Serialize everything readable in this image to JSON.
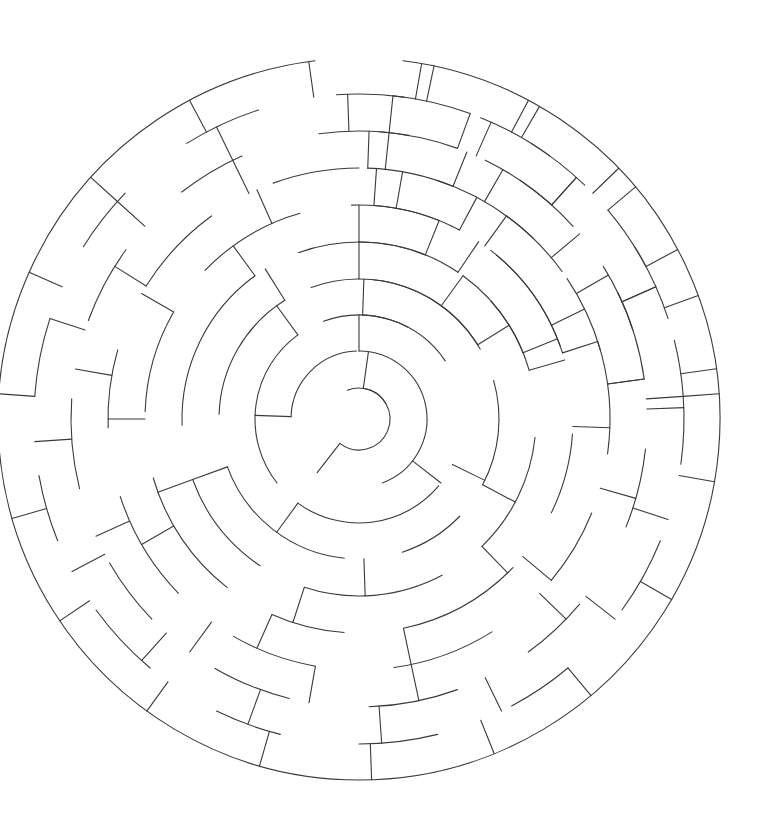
{
  "page": {
    "background_color": "#ffffff",
    "width": 759,
    "height": 827
  },
  "maze": {
    "kind": "circular-radial-maze",
    "description": "Concentric-ring maze with arc walls and radial walls",
    "stroke_color": "#3a3a3a",
    "stroke_width": 1.1,
    "center": {
      "x": 359,
      "y": 419
    },
    "ring_count": 10,
    "ring_radii": [
      31,
      68,
      104,
      140,
      177,
      214,
      251,
      288,
      325,
      361
    ],
    "entrance": {
      "ring": 9,
      "angle_deg": -90,
      "label": "top-entrance-gap"
    },
    "exit": {
      "ring": 0,
      "angle_deg": 215,
      "label": "center-goal-gap"
    },
    "arc_walls": [
      [
        0,
        -82,
        210
      ],
      [
        0,
        248,
        82
      ],
      [
        1,
        -90,
        160
      ],
      [
        1,
        182,
        86
      ],
      [
        2,
        -88,
        26
      ],
      [
        2,
        40,
        86
      ],
      [
        2,
        142,
        92
      ],
      [
        2,
        250,
        76
      ],
      [
        3,
        -84,
        52
      ],
      [
        3,
        -16,
        44
      ],
      [
        3,
        44,
        28
      ],
      [
        3,
        96,
        64
      ],
      [
        3,
        182,
        56
      ],
      [
        3,
        250,
        80
      ],
      [
        4,
        -90,
        34
      ],
      [
        4,
        -42,
        26
      ],
      [
        4,
        6,
        40
      ],
      [
        4,
        62,
        46
      ],
      [
        4,
        124,
        36
      ],
      [
        4,
        178,
        56
      ],
      [
        4,
        250,
        42
      ],
      [
        4,
        306,
        32
      ],
      [
        5,
        -86,
        24
      ],
      [
        5,
        -50,
        30
      ],
      [
        5,
        4,
        22
      ],
      [
        5,
        44,
        34
      ],
      [
        5,
        94,
        20
      ],
      [
        5,
        128,
        36
      ],
      [
        5,
        182,
        28
      ],
      [
        5,
        224,
        30
      ],
      [
        5,
        268,
        24
      ],
      [
        5,
        308,
        34
      ],
      [
        6,
        -88,
        20
      ],
      [
        6,
        -54,
        18
      ],
      [
        6,
        -18,
        26
      ],
      [
        6,
        22,
        18
      ],
      [
        6,
        58,
        24
      ],
      [
        6,
        100,
        20
      ],
      [
        6,
        136,
        26
      ],
      [
        6,
        178,
        18
      ],
      [
        6,
        212,
        22
      ],
      [
        6,
        250,
        20
      ],
      [
        6,
        288,
        26
      ],
      [
        6,
        326,
        18
      ],
      [
        7,
        -86,
        16
      ],
      [
        7,
        -56,
        14
      ],
      [
        7,
        -26,
        18
      ],
      [
        7,
        6,
        16
      ],
      [
        7,
        40,
        14
      ],
      [
        7,
        70,
        18
      ],
      [
        7,
        104,
        16
      ],
      [
        7,
        136,
        14
      ],
      [
        7,
        166,
        18
      ],
      [
        7,
        200,
        16
      ],
      [
        7,
        232,
        14
      ],
      [
        7,
        262,
        18
      ],
      [
        7,
        296,
        16
      ],
      [
        7,
        328,
        14
      ],
      [
        8,
        -84,
        14
      ],
      [
        8,
        -58,
        12
      ],
      [
        8,
        -32,
        14
      ],
      [
        8,
        -4,
        12
      ],
      [
        8,
        22,
        14
      ],
      [
        8,
        50,
        12
      ],
      [
        8,
        76,
        14
      ],
      [
        8,
        104,
        12
      ],
      [
        8,
        130,
        14
      ],
      [
        8,
        158,
        12
      ],
      [
        8,
        184,
        14
      ],
      [
        8,
        212,
        12
      ],
      [
        8,
        238,
        14
      ],
      [
        8,
        266,
        12
      ],
      [
        8,
        292,
        14
      ],
      [
        8,
        320,
        12
      ],
      [
        8,
        346,
        10
      ]
    ],
    "radial_walls": [
      [
        0,
        1,
        -82
      ],
      [
        0,
        1,
        128
      ],
      [
        1,
        2,
        -90
      ],
      [
        1,
        2,
        38
      ],
      [
        1,
        2,
        182
      ],
      [
        2,
        3,
        -88
      ],
      [
        2,
        3,
        26
      ],
      [
        2,
        3,
        126
      ],
      [
        2,
        3,
        234
      ],
      [
        3,
        4,
        -90
      ],
      [
        3,
        4,
        -32
      ],
      [
        3,
        4,
        28
      ],
      [
        3,
        4,
        88
      ],
      [
        3,
        4,
        160
      ],
      [
        3,
        4,
        238
      ],
      [
        3,
        4,
        306
      ],
      [
        4,
        5,
        -90
      ],
      [
        4,
        5,
        -56
      ],
      [
        4,
        5,
        -16
      ],
      [
        4,
        5,
        46
      ],
      [
        4,
        5,
        108
      ],
      [
        4,
        5,
        160
      ],
      [
        4,
        5,
        234
      ],
      [
        4,
        5,
        292
      ],
      [
        4,
        5,
        338
      ],
      [
        5,
        6,
        -86
      ],
      [
        5,
        6,
        -62
      ],
      [
        5,
        6,
        -26
      ],
      [
        5,
        6,
        2
      ],
      [
        5,
        6,
        40
      ],
      [
        5,
        6,
        78
      ],
      [
        5,
        6,
        114
      ],
      [
        5,
        6,
        150
      ],
      [
        5,
        6,
        180
      ],
      [
        5,
        6,
        210
      ],
      [
        5,
        6,
        246
      ],
      [
        5,
        6,
        280
      ],
      [
        5,
        6,
        306
      ],
      [
        5,
        6,
        342
      ],
      [
        6,
        7,
        -88
      ],
      [
        6,
        7,
        -68
      ],
      [
        6,
        7,
        -40
      ],
      [
        6,
        7,
        -8
      ],
      [
        6,
        7,
        16
      ],
      [
        6,
        7,
        44
      ],
      [
        6,
        7,
        78
      ],
      [
        6,
        7,
        100
      ],
      [
        6,
        7,
        126
      ],
      [
        6,
        7,
        156
      ],
      [
        6,
        7,
        190
      ],
      [
        6,
        7,
        212
      ],
      [
        6,
        7,
        244
      ],
      [
        6,
        7,
        276
      ],
      [
        6,
        7,
        300
      ],
      [
        6,
        7,
        330
      ],
      [
        6,
        7,
        352
      ],
      [
        7,
        8,
        -84
      ],
      [
        7,
        8,
        -66
      ],
      [
        7,
        8,
        -48
      ],
      [
        7,
        8,
        -24
      ],
      [
        7,
        8,
        -2
      ],
      [
        7,
        8,
        18
      ],
      [
        7,
        8,
        38
      ],
      [
        7,
        8,
        64
      ],
      [
        7,
        8,
        86
      ],
      [
        7,
        8,
        110
      ],
      [
        7,
        8,
        132
      ],
      [
        7,
        8,
        152
      ],
      [
        7,
        8,
        176
      ],
      [
        7,
        8,
        198
      ],
      [
        7,
        8,
        222
      ],
      [
        7,
        8,
        244
      ],
      [
        7,
        8,
        268
      ],
      [
        7,
        8,
        290
      ],
      [
        7,
        8,
        312
      ],
      [
        7,
        8,
        336
      ],
      [
        7,
        8,
        356
      ],
      [
        8,
        9,
        -80
      ],
      [
        8,
        9,
        -62
      ],
      [
        8,
        9,
        -44
      ],
      [
        8,
        9,
        -28
      ],
      [
        8,
        9,
        -8
      ],
      [
        8,
        9,
        10
      ],
      [
        8,
        9,
        30
      ],
      [
        8,
        9,
        50
      ],
      [
        8,
        9,
        68
      ],
      [
        8,
        9,
        88
      ],
      [
        8,
        9,
        106
      ],
      [
        8,
        9,
        126
      ],
      [
        8,
        9,
        146
      ],
      [
        8,
        9,
        164
      ],
      [
        8,
        9,
        184
      ],
      [
        8,
        9,
        204
      ],
      [
        8,
        9,
        222
      ],
      [
        8,
        9,
        242
      ],
      [
        8,
        9,
        262
      ],
      [
        8,
        9,
        282
      ],
      [
        8,
        9,
        300
      ],
      [
        8,
        9,
        320
      ],
      [
        8,
        9,
        340
      ],
      [
        8,
        9,
        356
      ]
    ],
    "outer_boundary_gaps": [
      [
        -97,
        -83
      ]
    ]
  }
}
